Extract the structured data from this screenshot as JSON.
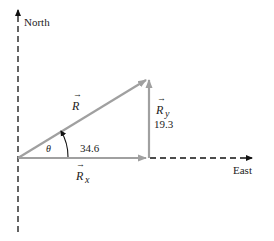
{
  "axes": {
    "north_label": "North",
    "east_label": "East"
  },
  "vectors": {
    "resultant": {
      "label": "R",
      "color": "#a0a0a0"
    },
    "x_component": {
      "label": "R",
      "subscript": "x",
      "value": "34.6",
      "color": "#a0a0a0"
    },
    "y_component": {
      "label": "R",
      "subscript": "y",
      "value": "19.3",
      "color": "#a0a0a0"
    }
  },
  "angle": {
    "label": "θ"
  }
}
